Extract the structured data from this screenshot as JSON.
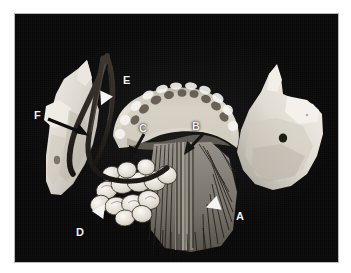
{
  "figure": {
    "kind": "anatomical-photograph",
    "background_color": "#090909",
    "mount_color": "#ffffff",
    "bone_color": "#e8e4dc",
    "label_color": "#f2f2f2",
    "pointer_black": "#0a0a0a",
    "pointer_white": "#f4f4f4"
  },
  "labels": [
    {
      "id": "a",
      "text": "A",
      "x": 221,
      "y": 197
    },
    {
      "id": "b",
      "text": "B",
      "x": 177,
      "y": 107
    },
    {
      "id": "c",
      "text": "C",
      "x": 124,
      "y": 109
    },
    {
      "id": "d",
      "text": "D",
      "x": 61,
      "y": 213
    },
    {
      "id": "e",
      "text": "E",
      "x": 108,
      "y": 61
    },
    {
      "id": "f",
      "text": "F",
      "x": 19,
      "y": 96
    }
  ],
  "pointers": {
    "black_arrows": [
      {
        "id": "arrow-f",
        "from": [
          33,
          105
        ],
        "to": [
          72,
          120
        ]
      },
      {
        "id": "arrow-c",
        "from": [
          128,
          121
        ],
        "to": [
          118,
          142
        ]
      },
      {
        "id": "arrow-b",
        "from": [
          188,
          120
        ],
        "to": [
          172,
          139
        ]
      }
    ],
    "white_arrowheads": [
      {
        "id": "arrowhead-e",
        "x": 88,
        "y": 84,
        "rotation": 205
      },
      {
        "id": "arrowhead-d",
        "x": 86,
        "y": 196,
        "rotation": 35
      },
      {
        "id": "arrowhead-a",
        "x": 198,
        "y": 191,
        "rotation": 250
      }
    ]
  },
  "structures": [
    {
      "id": "ramus-left",
      "name": "left-mandibular-ramus"
    },
    {
      "id": "ramus-right",
      "name": "right-mandibular-ramus"
    },
    {
      "id": "dental-arch",
      "name": "mandibular-dental-arch"
    },
    {
      "id": "muscle-fibers",
      "name": "genioglossus-mylohyoid-muscle-fibers"
    },
    {
      "id": "gland",
      "name": "sublingual-salivary-gland"
    },
    {
      "id": "nerve",
      "name": "lingual-nerve-loop"
    },
    {
      "id": "mandibular-foramen",
      "name": "mandibular-foramen"
    }
  ]
}
